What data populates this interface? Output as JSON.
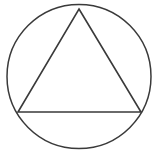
{
  "figure": {
    "background_color": "#ffffff",
    "stroke_color": "#3a3a3a",
    "canvas": {
      "width": 160,
      "height": 159
    },
    "circle": {
      "name": "outer-circle",
      "center_x": 79,
      "center_y": 76.5,
      "radius": 72,
      "stroke_width": 1.5
    },
    "triangle": {
      "name": "inscribed-triangle",
      "orientation": "apex-up",
      "stroke_width": 1.6,
      "points": "79,9 141,112 18,112",
      "vertices": [
        {
          "label": "apex",
          "x": 79,
          "y": 9
        },
        {
          "label": "bottom-right",
          "x": 141,
          "y": 112
        },
        {
          "label": "bottom-left",
          "x": 18,
          "y": 112
        }
      ]
    }
  }
}
